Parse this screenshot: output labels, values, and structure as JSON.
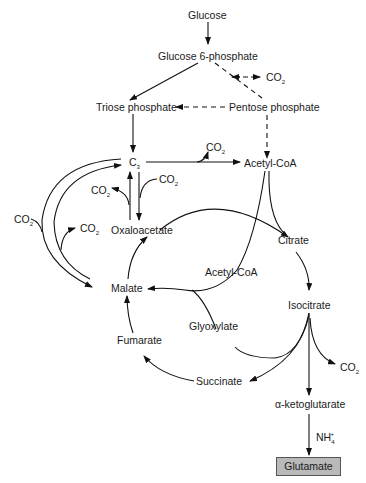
{
  "diagram": {
    "type": "metabolic-pathway",
    "nodes": {
      "glucose": "Glucose",
      "glucose6p": "Glucose 6-phosphate",
      "triose_phosphate": "Triose phosphate",
      "pentose_phosphate": "Pentose phosphate",
      "c3": "C",
      "c3_sub": "3",
      "acetyl_coa_top": "Acetyl-CoA",
      "oxaloacetate": "Oxaloacetate",
      "citrate": "Citrate",
      "acetyl_coa_mid": "Acetyl-CoA",
      "malate": "Malate",
      "isocitrate": "Isocitrate",
      "glyoxylate": "Glyoxylate",
      "fumarate": "Fumarate",
      "succinate": "Succinate",
      "alpha_ketoglutarate": "α-ketoglutarate",
      "glutamate": "Glutamate"
    },
    "co2_label": "CO",
    "co2_sub": "2",
    "nh4_label": "NH",
    "nh4_sub": "4",
    "nh4_sup": "+",
    "highlight_color": "#b9b9b9",
    "edges": [
      {
        "from": "Glucose",
        "to": "Glucose 6-phosphate",
        "style": "solid"
      },
      {
        "from": "Glucose 6-phosphate",
        "to": "Triose phosphate",
        "style": "solid"
      },
      {
        "from": "Glucose 6-phosphate",
        "to": "Pentose phosphate",
        "style": "dashed",
        "releases": "CO2"
      },
      {
        "from": "Pentose phosphate",
        "to": "Triose phosphate",
        "style": "dashed"
      },
      {
        "from": "Pentose phosphate",
        "to": "Acetyl-CoA",
        "style": "dashed"
      },
      {
        "from": "Triose phosphate",
        "to": "C3",
        "style": "solid"
      },
      {
        "from": "C3",
        "to": "Acetyl-CoA",
        "style": "solid",
        "releases": "CO2"
      },
      {
        "from": "C3",
        "to": "Oxaloacetate",
        "style": "solid",
        "consumes": "CO2"
      },
      {
        "from": "Oxaloacetate",
        "to": "C3",
        "style": "solid",
        "releases": "CO2"
      },
      {
        "from": "C3",
        "to": "Malate",
        "style": "solid",
        "consumes": "CO2"
      },
      {
        "from": "Malate",
        "to": "C3",
        "style": "solid",
        "releases": "CO2"
      },
      {
        "from": "Oxaloacetate",
        "to": "Citrate",
        "style": "solid",
        "joins": "Acetyl-CoA"
      },
      {
        "from": "Citrate",
        "to": "Isocitrate",
        "style": "solid"
      },
      {
        "from": "Isocitrate",
        "to": "Glyoxylate",
        "style": "solid"
      },
      {
        "from": "Glyoxylate",
        "to": "Malate",
        "style": "solid",
        "joins": "Acetyl-CoA"
      },
      {
        "from": "Isocitrate",
        "to": "Succinate",
        "style": "solid"
      },
      {
        "from": "Succinate",
        "to": "Fumarate",
        "style": "solid"
      },
      {
        "from": "Fumarate",
        "to": "Malate",
        "style": "solid"
      },
      {
        "from": "Malate",
        "to": "Oxaloacetate",
        "style": "solid"
      },
      {
        "from": "Isocitrate",
        "to": "α-ketoglutarate",
        "style": "solid",
        "releases": "CO2"
      },
      {
        "from": "α-ketoglutarate",
        "to": "Glutamate",
        "style": "solid",
        "consumes": "NH4+"
      }
    ]
  }
}
